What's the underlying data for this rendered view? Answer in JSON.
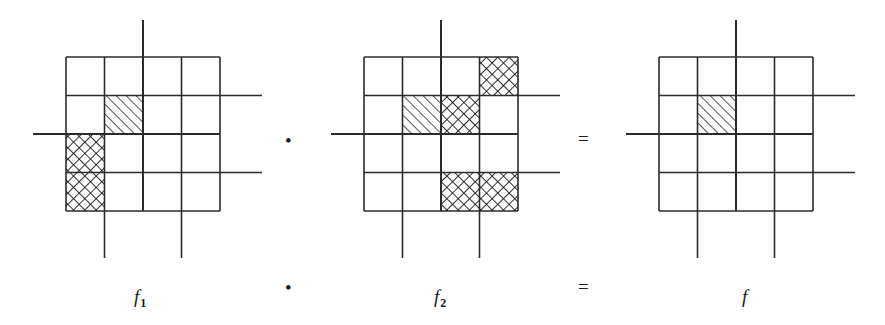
{
  "figure": {
    "type": "math-diagram",
    "equation_text": "f1 · f2 = f",
    "line_color": "#2b2b2b",
    "hatch_color": "#1a1a1a",
    "background": "#ffffff",
    "grid": {
      "rows": 4,
      "cols": 4,
      "cell_size": 38.5,
      "stroke_width": 1.6
    },
    "panels": [
      {
        "id": "panel-f1",
        "label": "f",
        "subscript": "1",
        "label_x": 134,
        "label_y": 287,
        "origin_x": 66,
        "origin_y": 57,
        "axis": {
          "vertical_line_col": 2,
          "vertical_extend_top": 20,
          "vertical_extend_bottom": 0,
          "horizontal_line_row": 2,
          "horizontal_extend_left": 33,
          "horizontal_extend_right": 0
        },
        "extra_lines": [
          {
            "type": "h",
            "row": 1,
            "side": "right",
            "to": 262
          },
          {
            "type": "h",
            "row": 3,
            "side": "right",
            "to": 262
          },
          {
            "type": "v",
            "col": 1,
            "side": "bottom",
            "to": 258
          },
          {
            "type": "v",
            "col": 3,
            "side": "bottom",
            "to": 258
          }
        ],
        "cells": [
          {
            "row": 1,
            "col": 1,
            "fill": "diagonal"
          },
          {
            "row": 2,
            "col": 0,
            "fill": "crosshatch"
          },
          {
            "row": 3,
            "col": 0,
            "fill": "crosshatch"
          }
        ]
      },
      {
        "id": "panel-f2",
        "label": "f",
        "subscript": "2",
        "label_x": 434,
        "label_y": 287,
        "origin_x": 364,
        "origin_y": 57,
        "axis": {
          "vertical_line_col": 2,
          "vertical_extend_top": 20,
          "vertical_extend_bottom": 0,
          "horizontal_line_row": 2,
          "horizontal_extend_left": 331,
          "horizontal_extend_right": 0
        },
        "extra_lines": [
          {
            "type": "h",
            "row": 1,
            "side": "right",
            "to": 560
          },
          {
            "type": "h",
            "row": 3,
            "side": "right",
            "to": 560
          },
          {
            "type": "v",
            "col": 1,
            "side": "bottom",
            "to": 258
          },
          {
            "type": "v",
            "col": 3,
            "side": "bottom",
            "to": 258
          }
        ],
        "cells": [
          {
            "row": 0,
            "col": 3,
            "fill": "crosshatch"
          },
          {
            "row": 1,
            "col": 1,
            "fill": "diagonal"
          },
          {
            "row": 1,
            "col": 2,
            "fill": "crosshatch"
          },
          {
            "row": 3,
            "col": 2,
            "fill": "crosshatch"
          },
          {
            "row": 3,
            "col": 3,
            "fill": "crosshatch"
          }
        ]
      },
      {
        "id": "panel-f",
        "label": "f",
        "subscript": "",
        "label_x": 742,
        "label_y": 287,
        "origin_x": 659,
        "origin_y": 57,
        "axis": {
          "vertical_line_col": 2,
          "vertical_extend_top": 20,
          "vertical_extend_bottom": 0,
          "horizontal_line_row": 2,
          "horizontal_extend_left": 626,
          "horizontal_extend_right": 0
        },
        "extra_lines": [
          {
            "type": "h",
            "row": 1,
            "side": "right",
            "to": 855
          },
          {
            "type": "h",
            "row": 3,
            "side": "right",
            "to": 855
          },
          {
            "type": "v",
            "col": 1,
            "side": "bottom",
            "to": 258
          },
          {
            "type": "v",
            "col": 3,
            "side": "bottom",
            "to": 258
          }
        ],
        "cells": [
          {
            "row": 1,
            "col": 1,
            "fill": "diagonal"
          }
        ]
      }
    ],
    "operators": [
      {
        "id": "op-dot-top",
        "symbol": "•",
        "x": 285,
        "y": 131,
        "size": 19
      },
      {
        "id": "op-equals-top",
        "symbol": "=",
        "x": 578,
        "y": 129,
        "size": 19
      },
      {
        "id": "op-dot-bottom",
        "symbol": "•",
        "x": 285,
        "y": 278,
        "size": 19
      },
      {
        "id": "op-equals-bottom",
        "symbol": "=",
        "x": 578,
        "y": 277,
        "size": 19
      }
    ]
  }
}
